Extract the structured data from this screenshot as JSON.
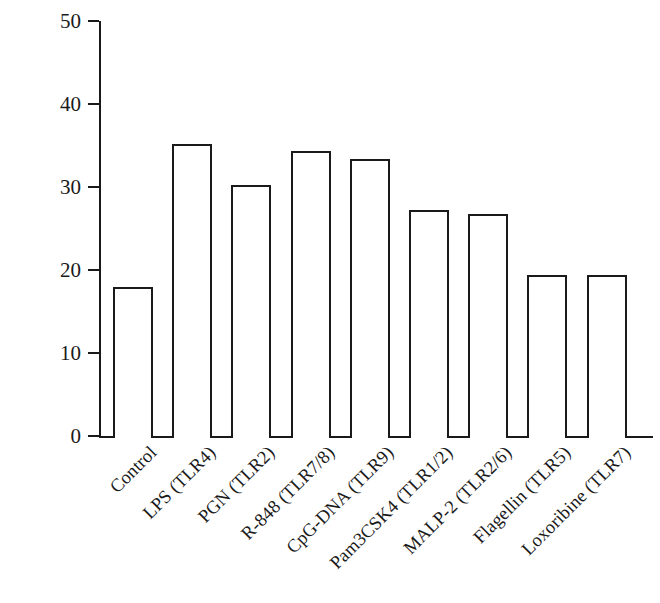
{
  "chart_data": {
    "type": "bar",
    "title": "",
    "xlabel": "",
    "ylabel": "Mean fluorescence intensity",
    "ylim": [
      0,
      50
    ],
    "yticks": [
      0,
      10,
      20,
      30,
      40,
      50
    ],
    "grid": false,
    "legend": null,
    "bar_style": {
      "fill": "#ffffff",
      "edge": "#1a1a1a",
      "edge_width_px": 2
    },
    "categories": [
      "Control",
      "LPS (TLR4)",
      "PGN (TLR2)",
      "R-848 (TLR7/8)",
      "CpG-DNA (TLR9)",
      "Pam3CSK4 (TLR1/2)",
      "MALP-2 (TLR2/6)",
      "Flagellin (TLR5)",
      "Loxoribine (TLR7)"
    ],
    "values": [
      18.0,
      35.2,
      30.3,
      34.3,
      33.4,
      27.2,
      26.8,
      19.4,
      19.4
    ]
  }
}
